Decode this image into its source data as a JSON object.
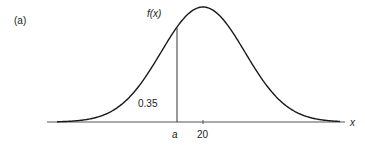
{
  "figure": {
    "panel_label": "(a)",
    "function_label": "f(x)",
    "x_axis_label": "x",
    "shaded_area_label": "0.35",
    "cutoff_label": "a",
    "mean_tick_label": "20"
  },
  "colors": {
    "curve": "#1a1a1a",
    "axis": "#555555",
    "text": "#222222"
  },
  "chart_data": {
    "type": "line",
    "title": "",
    "panel": "(a)",
    "xlabel": "x",
    "ylabel": "f(x)",
    "distribution": "normal",
    "mean": 20,
    "x_ticks": [
      {
        "label": "a",
        "note": "cutoff point left of the mean"
      },
      {
        "label": "20",
        "note": "mean / peak of curve"
      }
    ],
    "annotations": [
      {
        "text": "0.35",
        "meaning": "area under the curve to the left of a",
        "position": "left of vertical line at a"
      },
      {
        "text": "f(x)",
        "position": "above vertical line at a"
      }
    ],
    "grid": false,
    "legend": null
  }
}
